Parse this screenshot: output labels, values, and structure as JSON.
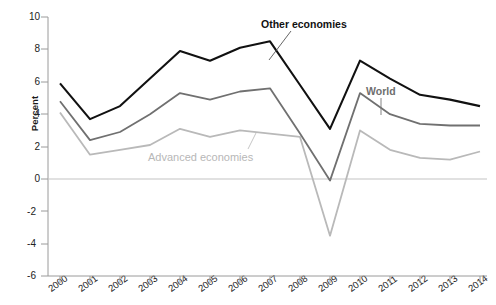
{
  "chart_data": {
    "type": "line",
    "title": "",
    "xlabel": "",
    "ylabel": "Percent",
    "ylim": [
      -6,
      10
    ],
    "yticks": [
      -6,
      -4,
      -2,
      0,
      2,
      4,
      6,
      8,
      10
    ],
    "ytick_labels": [
      "-6",
      "-4",
      "-2",
      "0",
      "2",
      "4",
      "6",
      "8",
      "10"
    ],
    "grid": false,
    "zero_line": true,
    "legend_position": "inline-annotations",
    "categories": [
      2000,
      2001,
      2002,
      2003,
      2004,
      2005,
      2006,
      2007,
      2008,
      2009,
      2010,
      2011,
      2012,
      2013,
      2014
    ],
    "xtick_labels": [
      "2000",
      "2001",
      "2002",
      "2003",
      "2004",
      "2005",
      "2006",
      "2007",
      "2008",
      "2009",
      "2010",
      "2011",
      "2012",
      "2013",
      "2014"
    ],
    "series": [
      {
        "name": "Other economies",
        "color": "#111111",
        "values": [
          5.9,
          3.7,
          4.5,
          6.2,
          7.9,
          7.3,
          8.1,
          8.5,
          5.8,
          3.1,
          7.3,
          6.2,
          5.2,
          4.9,
          4.5
        ]
      },
      {
        "name": "World",
        "color": "#707070",
        "values": [
          4.8,
          2.4,
          2.9,
          4.0,
          5.3,
          4.9,
          5.4,
          5.6,
          2.8,
          -0.1,
          5.3,
          4.0,
          3.4,
          3.3,
          3.3
        ]
      },
      {
        "name": "Advanced economies",
        "color": "#b9b9b9",
        "values": [
          4.1,
          1.5,
          1.8,
          2.1,
          3.1,
          2.6,
          3.0,
          2.8,
          2.6,
          -3.5,
          3.0,
          1.8,
          1.3,
          1.2,
          1.7
        ]
      }
    ],
    "annotations": [
      {
        "text": "Other economies",
        "series": "Other economies",
        "leader_line": true
      },
      {
        "text": "World",
        "series": "World",
        "leader_line": true
      },
      {
        "text": "Advanced economies",
        "series": "Advanced economies",
        "leader_line": true
      }
    ]
  },
  "axis": {
    "y_title": "Percent",
    "y_ticks": [
      "10",
      "8",
      "6",
      "4",
      "2",
      "0",
      "-2",
      "-4",
      "-6"
    ],
    "x_ticks": [
      "2000",
      "2001",
      "2002",
      "2003",
      "2004",
      "2005",
      "2006",
      "2007",
      "2008",
      "2009",
      "2010",
      "2011",
      "2012",
      "2013",
      "2014"
    ]
  },
  "labels": {
    "other_economies": "Other economies",
    "world": "World",
    "advanced_economies": "Advanced economies"
  },
  "colors": {
    "other_economies": "#111111",
    "world": "#707070",
    "advanced_economies": "#b9b9b9",
    "axis": "#9a9a9a",
    "zero_line": "#c4c4c4",
    "text": "#222222"
  }
}
